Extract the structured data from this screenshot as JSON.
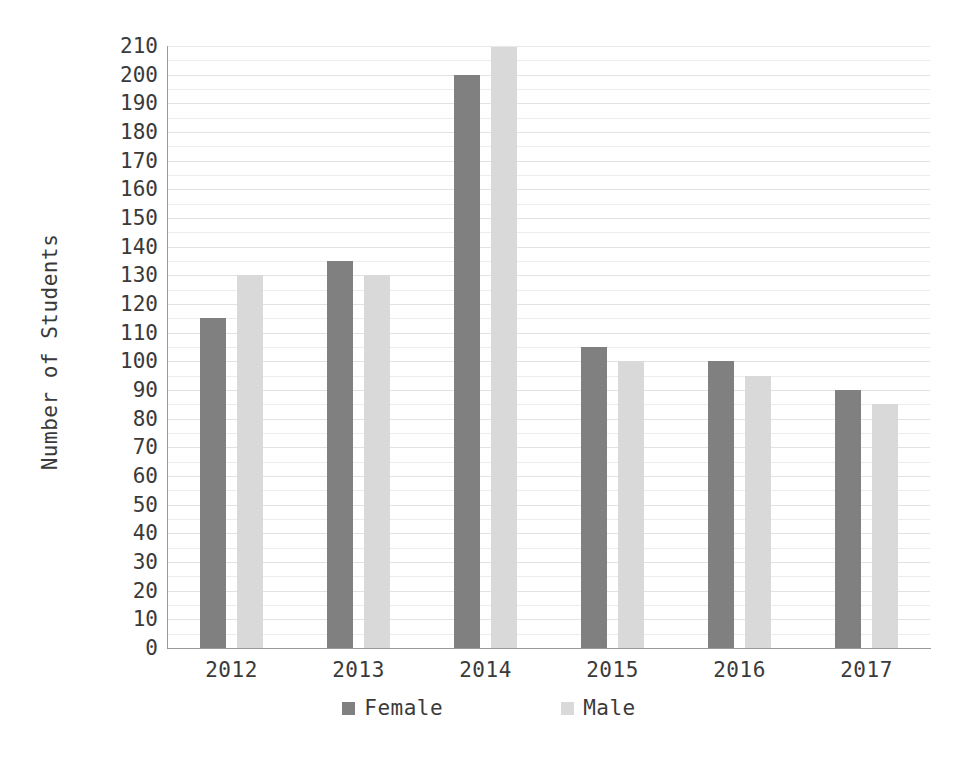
{
  "chart_data": {
    "type": "bar",
    "title": "",
    "subtitle": "",
    "xlabel": "",
    "ylabel": "Number of Students",
    "categories": [
      "2012",
      "2013",
      "2014",
      "2015",
      "2016",
      "2017"
    ],
    "series": [
      {
        "name": "Female",
        "color": "#808080",
        "values": [
          115,
          135,
          200,
          105,
          100,
          90
        ]
      },
      {
        "name": "Male",
        "color": "#d9d9d9",
        "values": [
          130,
          130,
          215,
          100,
          95,
          85
        ]
      }
    ],
    "ylim": [
      0,
      210
    ],
    "ytick_step": 10,
    "yticks": [
      "210",
      "200",
      "190",
      "180",
      "170",
      "160",
      "150",
      "140",
      "130",
      "120",
      "110",
      "100",
      "90",
      "80",
      "70",
      "60",
      "50",
      "40",
      "30",
      "20",
      "10",
      "0"
    ],
    "grid": true,
    "grid_axis": "y",
    "legend_position": "bottom"
  },
  "legend": {
    "items": [
      {
        "label": "Female",
        "swatch": "female-swatch"
      },
      {
        "label": "Male",
        "swatch": "male-swatch"
      }
    ]
  },
  "colors": {
    "female": "#808080",
    "male": "#d9d9d9",
    "axis": "#9a9a9a",
    "grid": "#ececec",
    "text": "#3a3a3a",
    "background": "#ffffff"
  }
}
